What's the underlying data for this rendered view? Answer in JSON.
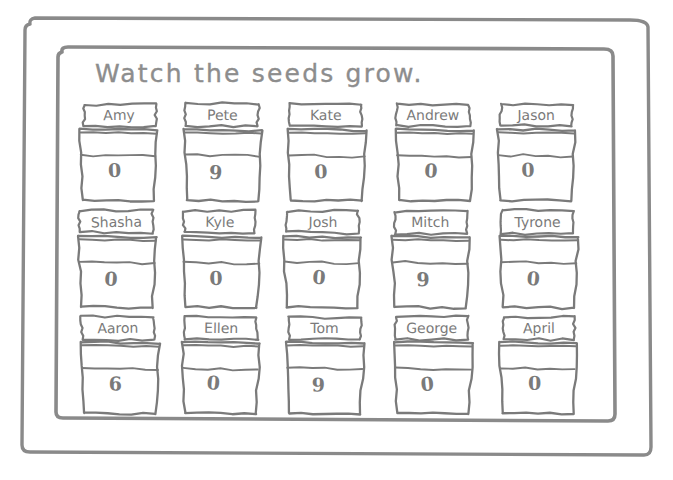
{
  "sheet": {
    "title": "Watch the seeds grow.",
    "ink_color": "#7a7a7a",
    "paper_color": "#ffffff",
    "frames": [
      "outer-border",
      "inner-border"
    ]
  },
  "grid": {
    "rows": 3,
    "columns": 5,
    "cells": [
      {
        "name": "Amy",
        "count": "0"
      },
      {
        "name": "Pete",
        "count": "9"
      },
      {
        "name": "Kate",
        "count": "0"
      },
      {
        "name": "Andrew",
        "count": "0"
      },
      {
        "name": "Jason",
        "count": "0"
      },
      {
        "name": "Shasha",
        "count": "0"
      },
      {
        "name": "Kyle",
        "count": "0"
      },
      {
        "name": "Josh",
        "count": "0"
      },
      {
        "name": "Mitch",
        "count": "9"
      },
      {
        "name": "Tyrone",
        "count": "0"
      },
      {
        "name": "Aaron",
        "count": "6"
      },
      {
        "name": "Ellen",
        "count": "0"
      },
      {
        "name": "Tom",
        "count": "9"
      },
      {
        "name": "George",
        "count": "0"
      },
      {
        "name": "April",
        "count": "0"
      }
    ]
  }
}
